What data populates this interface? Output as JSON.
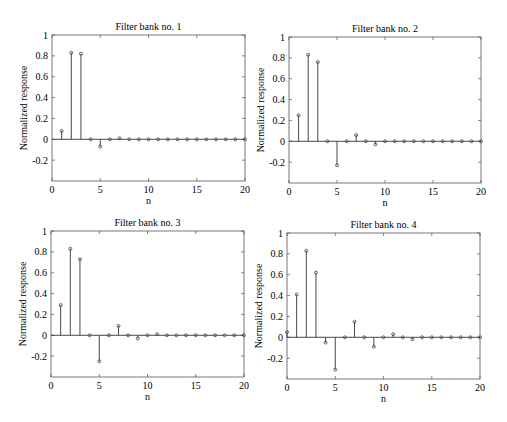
{
  "chart_data": [
    {
      "type": "stem",
      "title": "Filter bank no. 1",
      "xlabel": "n",
      "ylabel": "Normalized response",
      "xlim": [
        0,
        20
      ],
      "ylim": [
        -0.4,
        1
      ],
      "xticks": [
        0,
        5,
        10,
        15,
        20
      ],
      "yticks": [
        -0.2,
        0,
        0.2,
        0.4,
        0.6,
        0.8,
        1
      ],
      "grid": false,
      "x": [
        1,
        2,
        3,
        4,
        5,
        6,
        7,
        8,
        9,
        10,
        11,
        12,
        13,
        14,
        15,
        16,
        17,
        18,
        19,
        20
      ],
      "values": [
        0.08,
        0.83,
        0.82,
        0.0,
        -0.07,
        0.0,
        0.01,
        0.0,
        0.0,
        0.0,
        0.0,
        0.0,
        0.0,
        0.0,
        0.0,
        0.0,
        0.0,
        0.0,
        0.0,
        0.0
      ]
    },
    {
      "type": "stem",
      "title": "Filter bank no. 2",
      "xlabel": "n",
      "ylabel": "Normalized response",
      "xlim": [
        0,
        20
      ],
      "ylim": [
        -0.4,
        1
      ],
      "xticks": [
        0,
        5,
        10,
        15,
        20
      ],
      "yticks": [
        -0.2,
        0,
        0.2,
        0.4,
        0.6,
        0.8,
        1
      ],
      "grid": false,
      "x": [
        1,
        2,
        3,
        4,
        5,
        6,
        7,
        8,
        9,
        10,
        11,
        12,
        13,
        14,
        15,
        16,
        17,
        18,
        19,
        20
      ],
      "values": [
        0.25,
        0.83,
        0.76,
        0.0,
        -0.23,
        0.0,
        0.06,
        0.0,
        -0.03,
        0.0,
        0.0,
        0.0,
        0.0,
        0.0,
        0.0,
        0.0,
        0.0,
        0.0,
        0.0,
        0.0
      ]
    },
    {
      "type": "stem",
      "title": "Filter bank no. 3",
      "xlabel": "n",
      "ylabel": "Normalized response",
      "xlim": [
        0,
        20
      ],
      "ylim": [
        -0.4,
        1
      ],
      "xticks": [
        0,
        5,
        10,
        15,
        20
      ],
      "yticks": [
        -0.2,
        0,
        0.2,
        0.4,
        0.6,
        0.8,
        1
      ],
      "grid": false,
      "x": [
        1,
        2,
        3,
        4,
        5,
        6,
        7,
        8,
        9,
        10,
        11,
        12,
        13,
        14,
        15,
        16,
        17,
        18,
        19,
        20
      ],
      "values": [
        0.29,
        0.83,
        0.73,
        0.0,
        -0.25,
        0.0,
        0.09,
        0.0,
        -0.03,
        0.0,
        0.01,
        0.0,
        0.0,
        0.0,
        0.0,
        0.0,
        0.0,
        0.0,
        0.0,
        0.0
      ]
    },
    {
      "type": "stem",
      "title": "Filter bank no. 4",
      "xlabel": "n",
      "ylabel": "Normalized response",
      "xlim": [
        0,
        20
      ],
      "ylim": [
        -0.4,
        1
      ],
      "xticks": [
        0,
        5,
        10,
        15,
        20
      ],
      "yticks": [
        -0.2,
        0,
        0.2,
        0.4,
        0.6,
        0.8,
        1
      ],
      "grid": false,
      "x": [
        0,
        1,
        2,
        3,
        4,
        5,
        6,
        7,
        8,
        9,
        10,
        11,
        12,
        13,
        14,
        15,
        16,
        17,
        18,
        19,
        20
      ],
      "values": [
        0.05,
        0.41,
        0.83,
        0.62,
        -0.05,
        -0.31,
        0.0,
        0.15,
        0.0,
        -0.09,
        0.0,
        0.03,
        0.0,
        -0.02,
        0.0,
        0.0,
        0.0,
        0.0,
        0.0,
        0.0,
        0.0
      ]
    }
  ],
  "layout": {
    "axes_boxes": [
      {
        "left": 52,
        "top": 35,
        "right": 245,
        "bottom": 181
      },
      {
        "left": 289,
        "top": 37,
        "right": 481,
        "bottom": 183
      },
      {
        "left": 51,
        "top": 231,
        "right": 244,
        "bottom": 377
      },
      {
        "left": 287,
        "top": 233,
        "right": 480,
        "bottom": 379
      }
    ],
    "colors": {
      "axis": "#555555",
      "stem": "#333333",
      "marker": "#444444"
    }
  }
}
